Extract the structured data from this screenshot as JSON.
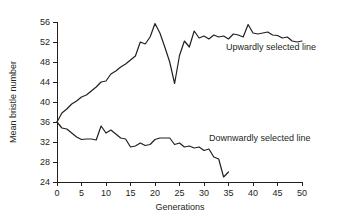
{
  "chart_data": {
    "type": "line",
    "title": "",
    "xlabel": "Generations",
    "ylabel": "Mean bristle number",
    "xlim": [
      0,
      50
    ],
    "ylim": [
      24,
      56
    ],
    "xticks": [
      0,
      5,
      10,
      15,
      20,
      25,
      30,
      35,
      40,
      45,
      50
    ],
    "yticks": [
      24,
      28,
      32,
      36,
      40,
      44,
      48,
      52,
      56
    ],
    "grid": false,
    "legend_position": "inline-annotation",
    "annotations": [
      {
        "text": "Upwardly selected line",
        "x": 34.5,
        "y": 50.4
      },
      {
        "text": "Downwardly selected line",
        "x": 31.0,
        "y": 32.2
      }
    ],
    "series": [
      {
        "name": "Upwardly selected line",
        "x": [
          0,
          1,
          2,
          3,
          4,
          5,
          6,
          7,
          8,
          9,
          10,
          11,
          12,
          13,
          14,
          15,
          16,
          17,
          18,
          19,
          20,
          21,
          22,
          23,
          24,
          25,
          26,
          27,
          28,
          29,
          30,
          31,
          32,
          33,
          34,
          35,
          36,
          37,
          38,
          39,
          40,
          41,
          42,
          43,
          44,
          45,
          46,
          47,
          48,
          49,
          50
        ],
        "values": [
          36.0,
          37.8,
          38.6,
          39.6,
          40.2,
          41.0,
          41.4,
          42.2,
          43.0,
          44.0,
          44.2,
          45.6,
          46.2,
          47.0,
          47.6,
          48.4,
          49.2,
          52.0,
          51.6,
          53.0,
          55.7,
          53.8,
          51.0,
          48.0,
          43.7,
          49.3,
          52.2,
          51.0,
          54.2,
          52.8,
          53.2,
          52.6,
          53.4,
          53.0,
          53.2,
          52.6,
          53.6,
          53.4,
          53.0,
          55.5,
          53.8,
          53.6,
          53.8,
          54.0,
          53.4,
          53.3,
          52.8,
          53.0,
          52.2,
          52.0,
          52.2
        ]
      },
      {
        "name": "Downwardly selected line",
        "x": [
          0,
          1,
          2,
          3,
          4,
          5,
          6,
          7,
          8,
          9,
          10,
          11,
          12,
          13,
          14,
          15,
          16,
          17,
          18,
          19,
          20,
          21,
          22,
          23,
          24,
          25,
          26,
          27,
          28,
          29,
          30,
          31,
          32,
          33,
          34,
          35
        ],
        "values": [
          36.0,
          34.8,
          34.6,
          33.8,
          33.0,
          32.5,
          32.6,
          32.6,
          32.4,
          35.2,
          33.8,
          34.4,
          33.6,
          32.8,
          32.6,
          31.0,
          31.2,
          31.8,
          31.3,
          31.5,
          32.5,
          32.8,
          32.8,
          32.8,
          31.5,
          31.8,
          31.0,
          31.2,
          30.8,
          31.0,
          30.3,
          30.6,
          29.0,
          28.6,
          25.0,
          26.0
        ]
      }
    ]
  },
  "axes": {
    "y_tick_labels": [
      "56",
      "52",
      "48",
      "44",
      "40",
      "36",
      "32",
      "28",
      "24"
    ],
    "x_tick_labels": [
      "0",
      "5",
      "10",
      "15",
      "20",
      "25",
      "30",
      "35",
      "40",
      "45",
      "50"
    ],
    "x_axis_title": "Generations",
    "y_axis_title": "Mean bristle number"
  },
  "colors": {
    "line": "#231f20",
    "axis": "#231f20",
    "background": "#ffffff"
  }
}
